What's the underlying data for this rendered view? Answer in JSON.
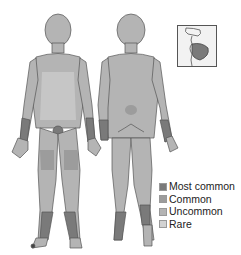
{
  "figure": {
    "views": [
      "front",
      "back",
      "lip-inset"
    ]
  },
  "colors": {
    "most_common": "#7a7a7a",
    "common": "#9c9c9c",
    "uncommon": "#b4b4b4",
    "rare": "#d2d2d2",
    "outline": "#555555"
  },
  "legend": {
    "items": [
      {
        "label": "Most common",
        "color": "#7a7a7a"
      },
      {
        "label": "Common",
        "color": "#9c9c9c"
      },
      {
        "label": "Uncommon",
        "color": "#b4b4b4"
      },
      {
        "label": "Rare",
        "color": "#d2d2d2"
      }
    ]
  }
}
